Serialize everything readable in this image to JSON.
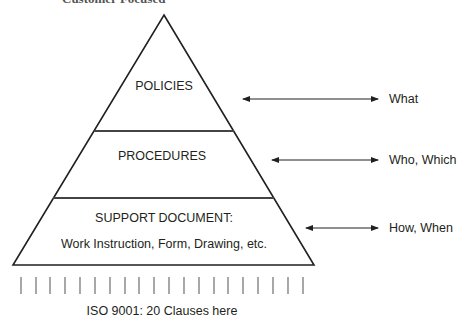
{
  "header": {
    "partial_title": "Customer Focused"
  },
  "pyramid": {
    "tiers": [
      {
        "id": "policies",
        "label": "POLICIES",
        "sublabel": ""
      },
      {
        "id": "procedures",
        "label": "PROCEDURES",
        "sublabel": ""
      },
      {
        "id": "support",
        "label": "SUPPORT DOCUMENT:",
        "sublabel": "Work Instruction, Form, Drawing, etc."
      }
    ]
  },
  "annotations": [
    {
      "tier": "policies",
      "label": "What"
    },
    {
      "tier": "procedures",
      "label": "Who, Which"
    },
    {
      "tier": "support",
      "label": "How, When"
    }
  ],
  "footer": {
    "tick_count": 20,
    "caption": "ISO 9001: 20 Clauses here"
  },
  "colors": {
    "line": "#231f20",
    "tick": "#6d6d6d",
    "background": "#ffffff"
  }
}
